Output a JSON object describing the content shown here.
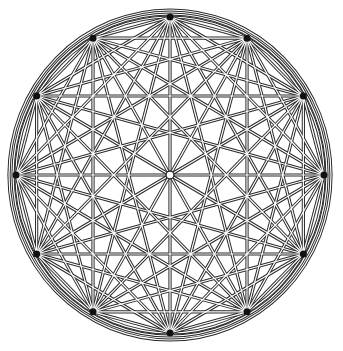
{
  "diagram": {
    "type": "complete-graph",
    "vertex_count": 12,
    "center": [
      170,
      175
    ],
    "radius_x": 154,
    "radius_y": 158,
    "start_angle_deg": -90,
    "outer_rings": [
      {
        "rx": 157,
        "ry": 161
      },
      {
        "rx": 161,
        "ry": 165
      }
    ],
    "center_circle_radius": 4,
    "colors": {
      "background": "#ffffff",
      "line_outer": "#2a2a2a",
      "line_inner": "#ffffff",
      "vertex": "#111111"
    },
    "line_outer_width": 3.2,
    "line_inner_width": 1.2
  }
}
